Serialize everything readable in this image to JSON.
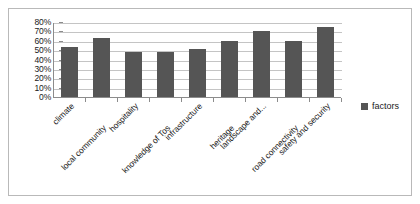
{
  "chart_data": {
    "type": "bar",
    "title": "",
    "xlabel": "",
    "ylabel": "",
    "ylim": [
      0,
      80
    ],
    "grid": true,
    "legend_position": "right",
    "categories": [
      "climate",
      "local community",
      "hospitality",
      "knowledge of Tos",
      "infrastructure",
      "heritage",
      "landscape and...",
      "road connectivity",
      "safety and security"
    ],
    "series": [
      {
        "name": "factors",
        "color": "#555555",
        "values": [
          53,
          63,
          48,
          48,
          51,
          60,
          70,
          60,
          75
        ]
      }
    ],
    "y_ticks": [
      "80%",
      "70%",
      "60%",
      "50%",
      "40%",
      "30%",
      "20%",
      "10%",
      "0%"
    ],
    "y_tick_values": [
      80,
      70,
      60,
      50,
      40,
      30,
      20,
      10,
      0
    ]
  },
  "legend": {
    "marker": "square-marker-icon",
    "label": "factors"
  },
  "colors": {
    "bar": "#555555",
    "gridline": "#c4c4c4",
    "axis": "#8c8c8c",
    "frame": "#b9b9b9",
    "text": "#1a1a1a"
  }
}
